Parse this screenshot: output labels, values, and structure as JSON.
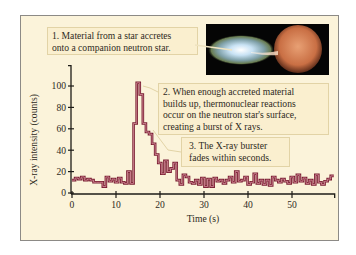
{
  "callouts": [
    {
      "lines": [
        "1. Material from a star accretes",
        "onto a companion neutron star."
      ]
    },
    {
      "lines": [
        "2. When enough accreted material",
        "builds up, thermonuclear reactions",
        "occur on the neutron star's surface,",
        "creating a burst of X rays."
      ]
    },
    {
      "lines": [
        "3. The X-ray burster",
        "fades within seconds."
      ]
    }
  ],
  "colors": {
    "panel_bg": "#fbf3da",
    "callout_bg": "#faefcf",
    "line": "#7a1f33",
    "line_fill": "#e9a5b0",
    "axis": "#1e1c18"
  },
  "chart_data": {
    "type": "line",
    "step": true,
    "title": "",
    "xlabel": "Time (s)",
    "ylabel": "X-ray intensity (counts)",
    "xlim": [
      0,
      60
    ],
    "ylim": [
      0,
      115
    ],
    "xticks": [
      0,
      10,
      20,
      30,
      40,
      50
    ],
    "yticks": [
      0,
      20,
      40,
      60,
      80,
      100
    ],
    "grid": false,
    "legend": null,
    "series": [
      {
        "name": "X-ray intensity",
        "x": [
          0,
          0.7,
          1.4,
          2.1,
          2.8,
          3.5,
          4.2,
          4.9,
          5.6,
          6.3,
          7.0,
          7.7,
          8.4,
          9.1,
          9.8,
          10.5,
          11.2,
          11.9,
          12.6,
          13.3,
          14.0,
          14.7,
          15.4,
          16.1,
          16.8,
          17.5,
          18.2,
          18.9,
          19.6,
          20.3,
          21.0,
          21.7,
          22.4,
          23.1,
          23.8,
          24.5,
          25.2,
          25.9,
          26.6,
          27.3,
          28.0,
          28.7,
          29.4,
          30.1,
          30.8,
          31.5,
          32.2,
          32.9,
          33.6,
          34.3,
          35.0,
          35.7,
          36.4,
          37.1,
          37.8,
          38.5,
          39.2,
          39.9,
          40.6,
          41.3,
          42.0,
          42.7,
          43.4,
          44.1,
          44.8,
          45.5,
          46.2,
          46.9,
          47.6,
          48.3,
          49.0,
          49.7,
          50.4,
          51.1,
          51.8,
          52.5,
          53.2,
          53.9,
          54.6,
          55.3,
          56.0,
          56.7,
          57.4,
          58.1,
          58.8
        ],
        "y": [
          12,
          14,
          13,
          15,
          12,
          13,
          12,
          10,
          10,
          10,
          6,
          15,
          11,
          13,
          10,
          14,
          10,
          9,
          20,
          9,
          65,
          103,
          92,
          65,
          57,
          55,
          46,
          36,
          28,
          18,
          30,
          20,
          23,
          28,
          12,
          8,
          17,
          15,
          10,
          9,
          12,
          8,
          14,
          6,
          13,
          6,
          14,
          11,
          12,
          9,
          12,
          15,
          10,
          20,
          11,
          12,
          15,
          8,
          10,
          18,
          9,
          12,
          8,
          12,
          7,
          15,
          12,
          10,
          13,
          11,
          9,
          15,
          10,
          17,
          11,
          14,
          9,
          12,
          8,
          17,
          10,
          8,
          11,
          13,
          16
        ]
      }
    ]
  }
}
